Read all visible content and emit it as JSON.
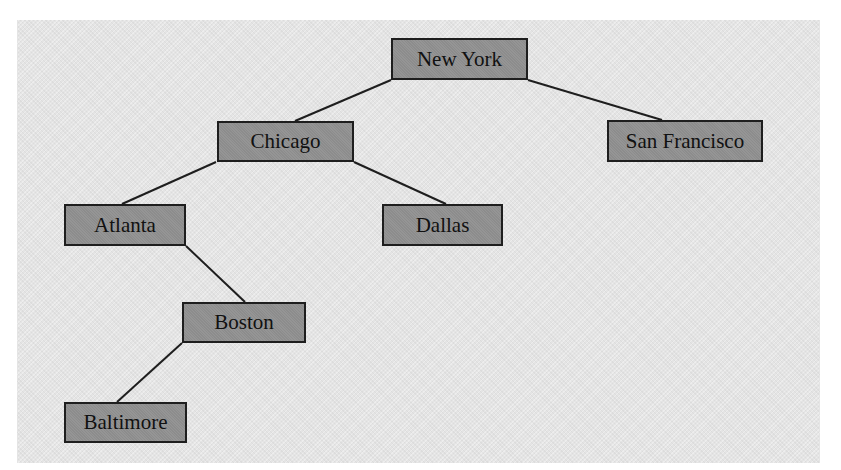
{
  "diagram": {
    "type": "tree",
    "colors": {
      "background": "#ffffff",
      "panel": "#e4e4e4",
      "node_fill": "#959595",
      "node_border": "#1e1e1e",
      "edge": "#1e1e1e",
      "text": "#111111"
    },
    "nodes": [
      {
        "id": "new-york",
        "label": "New York",
        "x": 391,
        "y": 38,
        "w": 137,
        "h": 42
      },
      {
        "id": "chicago",
        "label": "Chicago",
        "x": 217,
        "y": 121,
        "w": 137,
        "h": 41
      },
      {
        "id": "san-francisco",
        "label": "San Francisco",
        "x": 607,
        "y": 120,
        "w": 156,
        "h": 42
      },
      {
        "id": "atlanta",
        "label": "Atlanta",
        "x": 64,
        "y": 204,
        "w": 122,
        "h": 42
      },
      {
        "id": "dallas",
        "label": "Dallas",
        "x": 382,
        "y": 204,
        "w": 121,
        "h": 42
      },
      {
        "id": "boston",
        "label": "Boston",
        "x": 182,
        "y": 302,
        "w": 124,
        "h": 41
      },
      {
        "id": "baltimore",
        "label": "Baltimore",
        "x": 64,
        "y": 402,
        "w": 123,
        "h": 41
      }
    ],
    "edges": [
      {
        "from": "new-york",
        "to": "chicago",
        "x1": 391,
        "y1": 80,
        "x2": 295,
        "y2": 121
      },
      {
        "from": "new-york",
        "to": "san-francisco",
        "x1": 528,
        "y1": 80,
        "x2": 662,
        "y2": 120
      },
      {
        "from": "chicago",
        "to": "atlanta",
        "x1": 216,
        "y1": 162,
        "x2": 122,
        "y2": 204
      },
      {
        "from": "chicago",
        "to": "dallas",
        "x1": 354,
        "y1": 162,
        "x2": 446,
        "y2": 204
      },
      {
        "from": "atlanta",
        "to": "boston",
        "x1": 186,
        "y1": 246,
        "x2": 245,
        "y2": 302
      },
      {
        "from": "boston",
        "to": "baltimore",
        "x1": 182,
        "y1": 343,
        "x2": 117,
        "y2": 402
      }
    ]
  }
}
